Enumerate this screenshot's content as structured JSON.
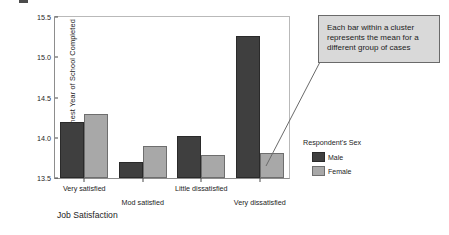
{
  "chart_data": {
    "type": "bar",
    "title": "",
    "xlabel": "Job Satisfaction",
    "ylabel": "Mean Highest Year of School Completed",
    "categories": [
      "Very satisfied",
      "Mod satisfied",
      "Little dissatisfied",
      "Very dissatisfied"
    ],
    "series": [
      {
        "name": "Male",
        "color": "#3f3f3f",
        "values": [
          14.2,
          13.7,
          14.02,
          15.27
        ]
      },
      {
        "name": "Female",
        "color": "#a8a8a8",
        "values": [
          14.3,
          13.9,
          13.79,
          13.81
        ]
      }
    ],
    "ylim": [
      13.5,
      15.5
    ],
    "yticks": [
      "15.5",
      "15.0",
      "14.5",
      "14.0",
      "13.5"
    ],
    "ytick_values": [
      15.5,
      15.0,
      14.5,
      14.0,
      13.5
    ],
    "grid": false,
    "legend_position": "right",
    "legend_title": "Respondent's Sex",
    "annotations": [
      "Each bar within a cluster represents the mean for a different group of cases"
    ]
  },
  "axes": {
    "y_title": "Mean Highest Year of School Completed",
    "x_title": "Job Satisfaction"
  },
  "legend": {
    "title": "Respondent's Sex",
    "items": [
      {
        "label": "Male",
        "color": "#3f3f3f"
      },
      {
        "label": "Female",
        "color": "#a8a8a8"
      }
    ]
  },
  "annotation": {
    "text": "Each bar within a cluster represents the mean for a different group of cases",
    "background": "#d9d9d9",
    "border": "#6a6a6a"
  }
}
